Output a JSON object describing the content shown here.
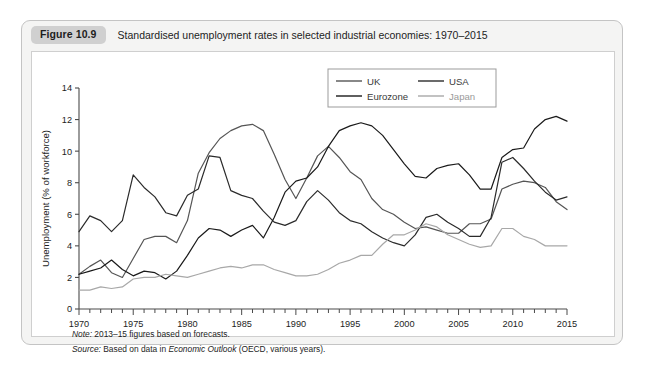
{
  "figure": {
    "badge": "Figure 10.9",
    "title": "Standardised unemployment rates in selected industrial economies: 1970–2015",
    "note": "Note:",
    "note_text": " 2013–15 figures based on forecasts.",
    "source": "Source:",
    "source_text_a": " Based on data in ",
    "source_italic": "Economic Outlook",
    "source_text_b": " (OECD, various years)."
  },
  "chart_data": {
    "type": "line",
    "title": "Standardised unemployment rates in selected industrial economies: 1970–2015",
    "xlabel": "",
    "ylabel": "Unemployment (% of workforce)",
    "xlim": [
      1970,
      2015
    ],
    "ylim": [
      0,
      14
    ],
    "yticks": [
      0,
      2,
      4,
      6,
      8,
      10,
      12,
      14
    ],
    "xticks": [
      1970,
      1975,
      1980,
      1985,
      1990,
      1995,
      2000,
      2005,
      2010,
      2015
    ],
    "xtick_labels": [
      "1970",
      "1975",
      "1980",
      "1985",
      "1990",
      "1995",
      "2000",
      "2005",
      "2010",
      "2015"
    ],
    "ytick_labels": [
      "0",
      "2",
      "4",
      "6",
      "8",
      "10",
      "12",
      "14"
    ],
    "x_minor_step": 1,
    "grid": false,
    "legend_position": "top-center",
    "x": [
      1970,
      1971,
      1972,
      1973,
      1974,
      1975,
      1976,
      1977,
      1978,
      1979,
      1980,
      1981,
      1982,
      1983,
      1984,
      1985,
      1986,
      1987,
      1988,
      1989,
      1990,
      1991,
      1992,
      1993,
      1994,
      1995,
      1996,
      1997,
      1998,
      1999,
      2000,
      2001,
      2002,
      2003,
      2004,
      2005,
      2006,
      2007,
      2008,
      2009,
      2010,
      2011,
      2012,
      2013,
      2014,
      2015
    ],
    "series": [
      {
        "name": "UK",
        "color": "#555555",
        "values": [
          2.2,
          2.7,
          3.1,
          2.3,
          2.0,
          3.2,
          4.4,
          4.6,
          4.6,
          4.2,
          5.6,
          8.6,
          9.9,
          10.8,
          11.3,
          11.6,
          11.7,
          11.3,
          9.8,
          8.2,
          7.0,
          8.3,
          9.7,
          10.3,
          9.6,
          8.7,
          8.2,
          7.0,
          6.3,
          6.0,
          5.5,
          5.1,
          5.2,
          5.0,
          4.8,
          4.8,
          5.4,
          5.4,
          5.7,
          7.6,
          7.9,
          8.1,
          8.0,
          7.7,
          6.8,
          6.3
        ],
        "style": "solid"
      },
      {
        "name": "USA",
        "color": "#2b2b2b",
        "values": [
          4.9,
          5.9,
          5.6,
          4.9,
          5.6,
          8.5,
          7.7,
          7.1,
          6.1,
          5.9,
          7.2,
          7.6,
          9.7,
          9.6,
          7.5,
          7.2,
          7.0,
          6.2,
          5.5,
          5.3,
          5.6,
          6.8,
          7.5,
          6.9,
          6.1,
          5.6,
          5.4,
          4.9,
          4.5,
          4.2,
          4.0,
          4.7,
          5.8,
          6.0,
          5.5,
          5.1,
          4.6,
          4.6,
          5.8,
          9.3,
          9.6,
          8.9,
          8.1,
          7.4,
          6.9,
          7.1
        ],
        "style": "solid"
      },
      {
        "name": "Eurozone",
        "color": "#1a1a1a",
        "values": [
          2.2,
          2.4,
          2.6,
          3.1,
          2.5,
          2.1,
          2.4,
          2.3,
          1.9,
          2.4,
          3.4,
          4.5,
          5.1,
          5.0,
          4.6,
          5.0,
          5.3,
          4.5,
          5.8,
          7.4,
          8.1,
          8.3,
          9.0,
          10.3,
          11.3,
          11.6,
          11.8,
          11.6,
          11.0,
          10.1,
          9.2,
          8.4,
          8.3,
          8.9,
          9.1,
          9.2,
          8.5,
          7.6,
          7.6,
          9.6,
          10.1,
          10.2,
          11.4,
          12.0,
          12.2,
          11.9
        ],
        "style": "solid"
      },
      {
        "name": "Japan",
        "color": "#a8a8a8",
        "values": [
          1.2,
          1.2,
          1.4,
          1.3,
          1.4,
          1.9,
          2.0,
          2.0,
          2.2,
          2.1,
          2.0,
          2.2,
          2.4,
          2.6,
          2.7,
          2.6,
          2.8,
          2.8,
          2.5,
          2.3,
          2.1,
          2.1,
          2.2,
          2.5,
          2.9,
          3.1,
          3.4,
          3.4,
          4.1,
          4.7,
          4.7,
          5.0,
          5.4,
          5.2,
          4.7,
          4.4,
          4.1,
          3.9,
          4.0,
          5.1,
          5.1,
          4.6,
          4.4,
          4.0,
          4.0,
          4.0
        ],
        "style": "solid"
      }
    ],
    "legend": [
      {
        "label": "UK",
        "color": "#555555"
      },
      {
        "label": "USA",
        "color": "#2b2b2b"
      },
      {
        "label": "Eurozone",
        "color": "#1a1a1a"
      },
      {
        "label": "Japan",
        "color": "#a8a8a8"
      }
    ]
  }
}
